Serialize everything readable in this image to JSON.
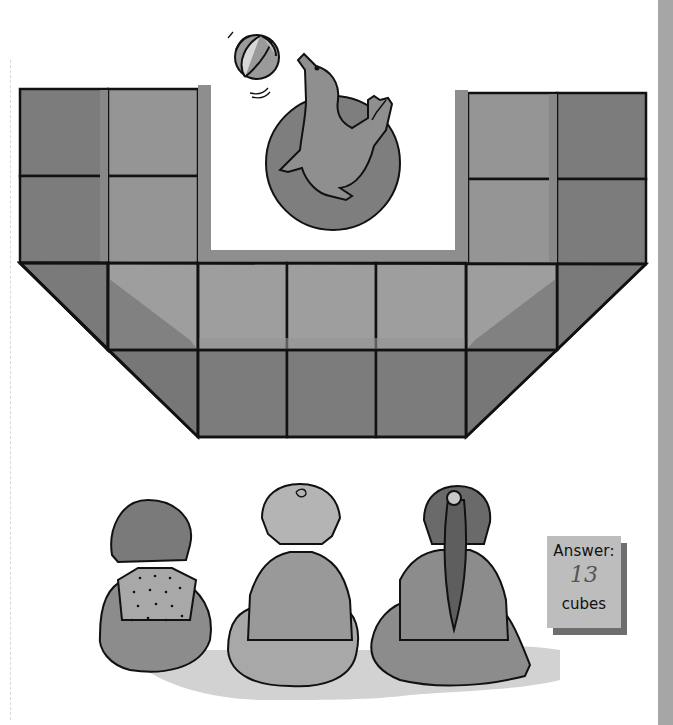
{
  "puzzle": {
    "title": "Count the cubes",
    "answer_box": {
      "label": "Answer:",
      "value": "13",
      "correction_mark": "½ ✓",
      "unit": "cubes"
    }
  },
  "illustration": {
    "performer": "seal balancing beach ball on circular platform",
    "audience": [
      "girl with bob haircut and polka-dot shirt",
      "boy with short hair",
      "girl with ponytail"
    ]
  },
  "colors": {
    "background": "#ffffff",
    "cube_dark": "#7a7a7a",
    "cube_mid": "#8c8c8c",
    "cube_light": "#999999",
    "cube_lighter": "#a8a8a8",
    "outline": "#111111",
    "side_bar": "#a6a6a6",
    "answer_box": "#bdbdbd",
    "answer_shadow": "#6e6e6e"
  }
}
